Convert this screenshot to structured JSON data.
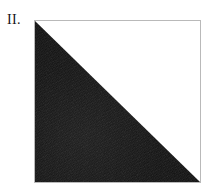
{
  "figure": {
    "label": "II.",
    "caption": "",
    "shape": "square",
    "shaded_region": "lower-left-triangle",
    "unshaded_region": "upper-right-triangle",
    "shaded_fraction": "1/2",
    "diagonal": "top-left-to-bottom-right",
    "colors": {
      "background": "#ffffff",
      "shading": "#111111",
      "outline": "#b9b9b9",
      "label_text": "#161616"
    },
    "geometry": {
      "square_left": 34,
      "square_top": 20,
      "square_width": 167,
      "square_height": 163
    }
  }
}
